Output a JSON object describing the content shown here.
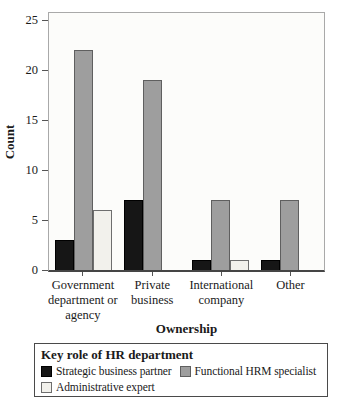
{
  "chart_data": {
    "type": "bar",
    "title": "",
    "xlabel": "Ownership",
    "ylabel": "Count",
    "ylim": [
      0,
      25
    ],
    "yticks": [
      0,
      5,
      10,
      15,
      20,
      25
    ],
    "grid": false,
    "plot_background": "#fcfcfa",
    "categories": [
      "Government department or agency",
      "Private business",
      "International company",
      "Other"
    ],
    "category_label_lines": [
      [
        "Government",
        "department or",
        "agency"
      ],
      [
        "Private",
        "business"
      ],
      [
        "International",
        "company"
      ],
      [
        "Other"
      ]
    ],
    "series": [
      {
        "name": "Strategic business partner",
        "fill": "#161616",
        "border": "#000000",
        "values": [
          3,
          7,
          1,
          1
        ]
      },
      {
        "name": "Functional HRM specialist",
        "fill": "#9e9e9e",
        "border": "#5f5f5f",
        "values": [
          22,
          19,
          7,
          7
        ]
      },
      {
        "name": "Administrative expert",
        "fill": "#f2f1ec",
        "border": "#6e6e6e",
        "values": [
          6,
          null,
          1,
          null
        ]
      }
    ],
    "legend": {
      "title": "Key role of HR department",
      "position": "bottom-box",
      "rows": [
        [
          0,
          1
        ],
        [
          2
        ]
      ]
    }
  }
}
